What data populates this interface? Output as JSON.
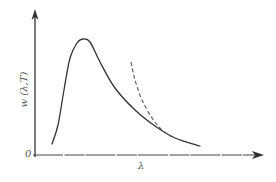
{
  "chart_data": {
    "type": "line",
    "title": "",
    "xlabel": "λ",
    "ylabel": "w (λ,T)",
    "origin_label": "0",
    "grid": false,
    "legend": null,
    "series": [
      {
        "name": "experimental / Planck curve",
        "style": "solid",
        "color": "#333333",
        "shape": "rises steeply from near zero, sharp peak at short λ, then long tail decaying toward zero at large λ",
        "points_px": [
          [
            52,
            144
          ],
          [
            58,
            125
          ],
          [
            64,
            90
          ],
          [
            70,
            58
          ],
          [
            77,
            43
          ],
          [
            83,
            39
          ],
          [
            90,
            42
          ],
          [
            100,
            62
          ],
          [
            115,
            88
          ],
          [
            135,
            110
          ],
          [
            155,
            126
          ],
          [
            175,
            138
          ],
          [
            200,
            146
          ]
        ]
      },
      {
        "name": "classical (Rayleigh-Jeans) curve",
        "style": "dashed",
        "color": "#555555",
        "shape": "diverges upward at short λ, merges with solid curve at long λ",
        "points_px": [
          [
            131,
            62
          ],
          [
            135,
            80
          ],
          [
            142,
            100
          ],
          [
            152,
            118
          ],
          [
            162,
            130
          ],
          [
            172,
            137
          ]
        ]
      }
    ],
    "axes": {
      "x_axis_px": {
        "from": [
          33,
          155
        ],
        "to": [
          262,
          155
        ],
        "arrow": true
      },
      "y_axis_px": {
        "from": [
          35,
          157
        ],
        "to": [
          35,
          12
        ],
        "arrow": true
      },
      "tick_labels": "none"
    }
  }
}
